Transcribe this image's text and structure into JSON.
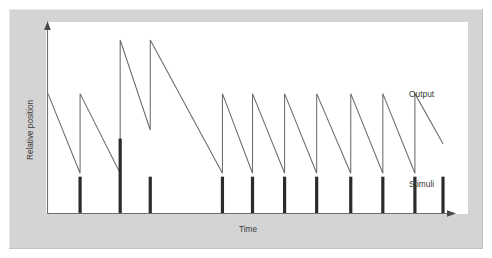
{
  "figure": {
    "background_color": "#ffffff",
    "frame_color": "#d4d4d4",
    "canvas_color": "#ffffff"
  },
  "chart_data": {
    "type": "line",
    "title": "",
    "subtitle": "",
    "xlabel": "Time",
    "ylabel": "Relative position",
    "xlim": [
      0,
      100
    ],
    "ylim": [
      0,
      100
    ],
    "grid": false,
    "axis_ticks": false,
    "tick_labels": [],
    "legend_position": "right-inline",
    "annotations": [
      {
        "name": "output-label",
        "text": "Output",
        "x": 92,
        "y": 56
      },
      {
        "name": "stimuli-label",
        "text": "Stimuli",
        "x": 92,
        "y": 19
      }
    ],
    "series": [
      {
        "name": "Output",
        "type": "line",
        "color": "#6b6b6b",
        "comment": "Sawtooth: ramps decay from a peak then jump up at each stimulus time.",
        "x": [
          0.0,
          8.0,
          8.0,
          18.0,
          18.0,
          25.5,
          25.5,
          43.5,
          43.5,
          51.0,
          51.0,
          59.0,
          59.0,
          67.0,
          67.0,
          75.5,
          75.5,
          83.5,
          83.5,
          91.5,
          91.5,
          98.5
        ],
        "y": [
          69.0,
          23.0,
          69.0,
          23.0,
          100.0,
          48.0,
          100.0,
          23.0,
          69.0,
          23.0,
          69.0,
          23.0,
          69.0,
          23.0,
          69.0,
          23.0,
          69.0,
          23.0,
          69.0,
          23.0,
          69.0,
          40.0
        ],
        "peaks": [
          69.0,
          69.0,
          100.0,
          100.0,
          69.0,
          69.0,
          69.0,
          69.0,
          69.0,
          69.0,
          69.0
        ],
        "troughs": [
          23.0,
          23.0,
          48.0,
          23.0,
          23.0,
          23.0,
          23.0,
          23.0,
          23.0,
          23.0,
          23.0
        ]
      },
      {
        "name": "Stimuli",
        "type": "impulse",
        "color": "#2b2b2b",
        "comment": "Vertical impulse bars on the baseline; the second impulse is roughly twice as tall.",
        "x": [
          8.0,
          18.0,
          25.5,
          43.5,
          51.0,
          59.0,
          67.0,
          75.5,
          83.5,
          91.5,
          98.5
        ],
        "y": [
          21.0,
          43.0,
          21.0,
          21.0,
          21.0,
          21.0,
          21.0,
          21.0,
          21.0,
          21.0,
          21.0
        ]
      }
    ]
  }
}
